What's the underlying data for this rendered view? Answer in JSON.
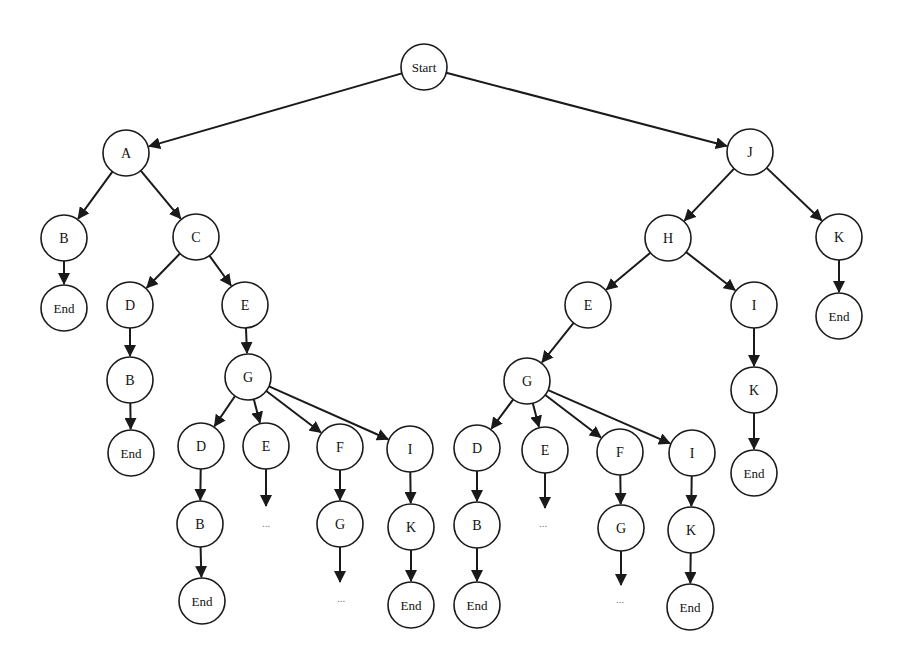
{
  "diagram": {
    "type": "tree",
    "node_radius": 23,
    "colors": {
      "stroke": "#1a1a1a",
      "fill": "#ffffff",
      "text": "#111111"
    },
    "nodes": [
      {
        "id": "start",
        "label": "Start",
        "x": 424,
        "y": 67
      },
      {
        "id": "a",
        "label": "A",
        "x": 126,
        "y": 153
      },
      {
        "id": "j",
        "label": "J",
        "x": 750,
        "y": 152
      },
      {
        "id": "a_b",
        "label": "B",
        "x": 64,
        "y": 238
      },
      {
        "id": "a_c",
        "label": "C",
        "x": 196,
        "y": 237
      },
      {
        "id": "a_b_end",
        "label": "End",
        "x": 64,
        "y": 308
      },
      {
        "id": "c_d",
        "label": "D",
        "x": 130,
        "y": 305
      },
      {
        "id": "c_e",
        "label": "E",
        "x": 245,
        "y": 305
      },
      {
        "id": "c_d_b",
        "label": "B",
        "x": 130,
        "y": 380
      },
      {
        "id": "c_d_b_end",
        "label": "End",
        "x": 131,
        "y": 453
      },
      {
        "id": "c_e_g",
        "label": "G",
        "x": 248,
        "y": 377
      },
      {
        "id": "lg_d",
        "label": "D",
        "x": 201,
        "y": 446
      },
      {
        "id": "lg_e",
        "label": "E",
        "x": 266,
        "y": 446
      },
      {
        "id": "lg_f",
        "label": "F",
        "x": 340,
        "y": 447
      },
      {
        "id": "lg_i",
        "label": "I",
        "x": 410,
        "y": 449
      },
      {
        "id": "lg_d_b",
        "label": "B",
        "x": 200,
        "y": 524
      },
      {
        "id": "lg_f_g",
        "label": "G",
        "x": 340,
        "y": 524
      },
      {
        "id": "lg_i_k",
        "label": "K",
        "x": 411,
        "y": 527
      },
      {
        "id": "lg_d_b_end",
        "label": "End",
        "x": 202,
        "y": 601
      },
      {
        "id": "lg_i_k_end",
        "label": "End",
        "x": 411,
        "y": 605
      },
      {
        "id": "j_h",
        "label": "H",
        "x": 668,
        "y": 238
      },
      {
        "id": "j_k",
        "label": "K",
        "x": 839,
        "y": 237
      },
      {
        "id": "j_k_end",
        "label": "End",
        "x": 839,
        "y": 316
      },
      {
        "id": "h_e",
        "label": "E",
        "x": 588,
        "y": 305
      },
      {
        "id": "h_i",
        "label": "I",
        "x": 754,
        "y": 305
      },
      {
        "id": "h_i_k",
        "label": "K",
        "x": 754,
        "y": 390
      },
      {
        "id": "h_i_k_end",
        "label": "End",
        "x": 754,
        "y": 473
      },
      {
        "id": "h_e_g",
        "label": "G",
        "x": 527,
        "y": 381
      },
      {
        "id": "rg_d",
        "label": "D",
        "x": 477,
        "y": 448
      },
      {
        "id": "rg_e",
        "label": "E",
        "x": 545,
        "y": 450
      },
      {
        "id": "rg_f",
        "label": "F",
        "x": 620,
        "y": 452
      },
      {
        "id": "rg_i",
        "label": "I",
        "x": 692,
        "y": 453
      },
      {
        "id": "rg_d_b",
        "label": "B",
        "x": 477,
        "y": 525
      },
      {
        "id": "rg_f_g",
        "label": "G",
        "x": 621,
        "y": 528
      },
      {
        "id": "rg_i_k",
        "label": "K",
        "x": 691,
        "y": 530
      },
      {
        "id": "rg_d_b_end",
        "label": "End",
        "x": 477,
        "y": 605
      },
      {
        "id": "rg_i_k_end",
        "label": "End",
        "x": 690,
        "y": 607
      }
    ],
    "edges": [
      [
        "start",
        "a"
      ],
      [
        "start",
        "j"
      ],
      [
        "a",
        "a_b"
      ],
      [
        "a",
        "a_c"
      ],
      [
        "a_b",
        "a_b_end"
      ],
      [
        "a_c",
        "c_d"
      ],
      [
        "a_c",
        "c_e"
      ],
      [
        "c_d",
        "c_d_b"
      ],
      [
        "c_d_b",
        "c_d_b_end"
      ],
      [
        "c_e",
        "c_e_g"
      ],
      [
        "c_e_g",
        "lg_d"
      ],
      [
        "c_e_g",
        "lg_e"
      ],
      [
        "c_e_g",
        "lg_f"
      ],
      [
        "c_e_g",
        "lg_i"
      ],
      [
        "lg_d",
        "lg_d_b"
      ],
      [
        "lg_d_b",
        "lg_d_b_end"
      ],
      [
        "lg_f",
        "lg_f_g"
      ],
      [
        "lg_i",
        "lg_i_k"
      ],
      [
        "lg_i_k",
        "lg_i_k_end"
      ],
      [
        "j",
        "j_h"
      ],
      [
        "j",
        "j_k"
      ],
      [
        "j_k",
        "j_k_end"
      ],
      [
        "j_h",
        "h_e"
      ],
      [
        "j_h",
        "h_i"
      ],
      [
        "h_i",
        "h_i_k"
      ],
      [
        "h_i_k",
        "h_i_k_end"
      ],
      [
        "h_e",
        "h_e_g"
      ],
      [
        "h_e_g",
        "rg_d"
      ],
      [
        "h_e_g",
        "rg_e"
      ],
      [
        "h_e_g",
        "rg_f"
      ],
      [
        "h_e_g",
        "rg_i"
      ],
      [
        "rg_d",
        "rg_d_b"
      ],
      [
        "rg_d_b",
        "rg_d_b_end"
      ],
      [
        "rg_f",
        "rg_f_g"
      ],
      [
        "rg_i",
        "rg_i_k"
      ],
      [
        "rg_i_k",
        "rg_i_k_end"
      ]
    ],
    "continuations": [
      {
        "from": "lg_e",
        "arrow_to_y": 506,
        "ellipsis": "...",
        "ex": 266,
        "ey": 527
      },
      {
        "from": "lg_f_g",
        "arrow_to_y": 582,
        "ellipsis": "...",
        "ex": 341,
        "ey": 602
      },
      {
        "from": "rg_e",
        "arrow_to_y": 508,
        "ellipsis": "...",
        "ex": 543,
        "ey": 527
      },
      {
        "from": "rg_f_g",
        "arrow_to_y": 585,
        "ellipsis": "...",
        "ex": 620,
        "ey": 603
      }
    ]
  }
}
